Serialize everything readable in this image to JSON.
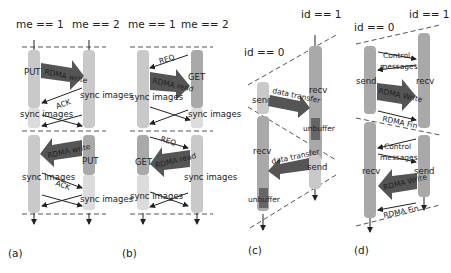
{
  "colors": {
    "bar_light": "#c9c9c9",
    "bar_mid": "#a9a9a9",
    "arrow_dark": "#555555",
    "dash": "#555555",
    "text": "#222222"
  },
  "panels": [
    {
      "id": "a",
      "label": "(a)",
      "headers": [
        "me == 1",
        "me == 2"
      ],
      "top": {
        "op_label": "PUT",
        "big_arrow": "RDMA write",
        "ack": "ACK",
        "sync_left": "sync images",
        "sync_right": "sync images"
      },
      "bottom": {
        "op_label": "PUT",
        "big_arrow": "RDMA write",
        "ack": "ACK",
        "sync_left": "sync images",
        "sync_right": "sync images"
      }
    },
    {
      "id": "b",
      "label": "(b)",
      "headers": [
        "me == 1",
        "me == 2"
      ],
      "top": {
        "op_label": "GET",
        "req": "REQ",
        "big_arrow": "RDMA read",
        "sync_left": "sync images",
        "sync_right": "sync images"
      },
      "bottom": {
        "op_label": "GET",
        "req": "REQ",
        "big_arrow": "RDMA read",
        "sync_left": "sync images",
        "sync_right": "sync images"
      }
    },
    {
      "id": "c",
      "label": "(c)",
      "headers": [
        "id == 0",
        "id == 1"
      ],
      "top": {
        "send": "send",
        "recv": "recv",
        "big_arrow": "data transfer",
        "unbuffer": "unbuffer"
      },
      "bottom": {
        "send": "send",
        "recv": "recv",
        "big_arrow": "data transfer",
        "unbuffer": "unbuffer"
      }
    },
    {
      "id": "d",
      "label": "(d)",
      "headers": [
        "id == 0",
        "id == 1"
      ],
      "top": {
        "send": "send",
        "recv": "recv",
        "control_line1": "Control",
        "control_line2": "messages",
        "big_arrow": "RDMA Write",
        "fin": "RDMA Fin"
      },
      "bottom": {
        "send": "send",
        "recv": "recv",
        "control_line1": "Control",
        "control_line2": "messages",
        "big_arrow": "RDMA Write",
        "fin": "RDMA Fin"
      }
    }
  ]
}
